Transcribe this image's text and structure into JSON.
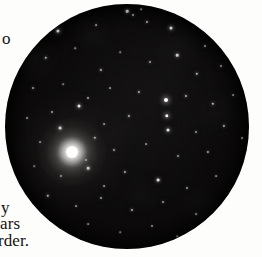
{
  "page": {
    "background_color": "#fdfdfb",
    "width": 262,
    "height": 257
  },
  "margin_text": {
    "top_fragment": "o",
    "bottom_fragment_1": "y",
    "bottom_fragment_2": "ars",
    "bottom_fragment_3": "rder."
  },
  "figure": {
    "kind": "telescopic-field-photograph",
    "shape": "circle",
    "center_x": 127,
    "center_y": 126,
    "radius": 122,
    "sky_color": "#0b0a0a",
    "star_color": "#ffffff",
    "primary_star": {
      "label": "bright-star",
      "x": 72,
      "y": 152,
      "core_radius": 6,
      "halo_radius": 34
    },
    "stars": [
      {
        "x": 127,
        "y": 11,
        "r": 1.3,
        "b": 0.8
      },
      {
        "x": 133,
        "y": 15,
        "r": 1.0,
        "b": 0.62
      },
      {
        "x": 141,
        "y": 9,
        "r": 0.8,
        "b": 0.5
      },
      {
        "x": 58,
        "y": 31,
        "r": 1.6,
        "b": 0.92
      },
      {
        "x": 96,
        "y": 25,
        "r": 0.9,
        "b": 0.55
      },
      {
        "x": 147,
        "y": 22,
        "r": 1.1,
        "b": 0.66
      },
      {
        "x": 171,
        "y": 28,
        "r": 1.5,
        "b": 0.88
      },
      {
        "x": 190,
        "y": 17,
        "r": 0.9,
        "b": 0.52
      },
      {
        "x": 205,
        "y": 46,
        "r": 1.0,
        "b": 0.58
      },
      {
        "x": 46,
        "y": 58,
        "r": 1.2,
        "b": 0.72
      },
      {
        "x": 75,
        "y": 48,
        "r": 0.8,
        "b": 0.48
      },
      {
        "x": 101,
        "y": 70,
        "r": 1.1,
        "b": 0.68
      },
      {
        "x": 120,
        "y": 52,
        "r": 0.8,
        "b": 0.46
      },
      {
        "x": 150,
        "y": 62,
        "r": 1.0,
        "b": 0.6
      },
      {
        "x": 177,
        "y": 55,
        "r": 1.3,
        "b": 0.78
      },
      {
        "x": 197,
        "y": 74,
        "r": 1.2,
        "b": 0.7
      },
      {
        "x": 221,
        "y": 66,
        "r": 1.0,
        "b": 0.58
      },
      {
        "x": 33,
        "y": 88,
        "r": 1.0,
        "b": 0.58
      },
      {
        "x": 63,
        "y": 84,
        "r": 0.8,
        "b": 0.44
      },
      {
        "x": 88,
        "y": 98,
        "r": 1.0,
        "b": 0.6
      },
      {
        "x": 110,
        "y": 88,
        "r": 0.9,
        "b": 0.5
      },
      {
        "x": 139,
        "y": 92,
        "r": 1.1,
        "b": 0.64
      },
      {
        "x": 166,
        "y": 100,
        "r": 2.0,
        "b": 1.0
      },
      {
        "x": 186,
        "y": 96,
        "r": 1.1,
        "b": 0.66
      },
      {
        "x": 213,
        "y": 104,
        "r": 1.2,
        "b": 0.72
      },
      {
        "x": 233,
        "y": 95,
        "r": 0.9,
        "b": 0.5
      },
      {
        "x": 27,
        "y": 118,
        "r": 0.9,
        "b": 0.5
      },
      {
        "x": 52,
        "y": 112,
        "r": 1.0,
        "b": 0.58
      },
      {
        "x": 79,
        "y": 106,
        "r": 1.5,
        "b": 0.9
      },
      {
        "x": 104,
        "y": 124,
        "r": 0.9,
        "b": 0.52
      },
      {
        "x": 129,
        "y": 116,
        "r": 1.1,
        "b": 0.66
      },
      {
        "x": 167,
        "y": 116,
        "r": 1.7,
        "b": 0.96
      },
      {
        "x": 168,
        "y": 130,
        "r": 1.5,
        "b": 0.88
      },
      {
        "x": 196,
        "y": 132,
        "r": 1.0,
        "b": 0.58
      },
      {
        "x": 224,
        "y": 126,
        "r": 1.1,
        "b": 0.64
      },
      {
        "x": 242,
        "y": 138,
        "r": 0.9,
        "b": 0.52
      },
      {
        "x": 40,
        "y": 142,
        "r": 0.9,
        "b": 0.5
      },
      {
        "x": 95,
        "y": 138,
        "r": 1.2,
        "b": 0.74
      },
      {
        "x": 114,
        "y": 150,
        "r": 1.0,
        "b": 0.58
      },
      {
        "x": 146,
        "y": 144,
        "r": 0.9,
        "b": 0.5
      },
      {
        "x": 178,
        "y": 156,
        "r": 1.0,
        "b": 0.56
      },
      {
        "x": 208,
        "y": 152,
        "r": 1.1,
        "b": 0.62
      },
      {
        "x": 34,
        "y": 166,
        "r": 0.8,
        "b": 0.44
      },
      {
        "x": 61,
        "y": 176,
        "r": 1.0,
        "b": 0.58
      },
      {
        "x": 88,
        "y": 168,
        "r": 1.3,
        "b": 0.8
      },
      {
        "x": 104,
        "y": 186,
        "r": 0.9,
        "b": 0.52
      },
      {
        "x": 125,
        "y": 172,
        "r": 1.1,
        "b": 0.64
      },
      {
        "x": 158,
        "y": 180,
        "r": 1.4,
        "b": 0.84
      },
      {
        "x": 187,
        "y": 188,
        "r": 1.0,
        "b": 0.56
      },
      {
        "x": 216,
        "y": 176,
        "r": 0.9,
        "b": 0.5
      },
      {
        "x": 48,
        "y": 196,
        "r": 1.2,
        "b": 0.72
      },
      {
        "x": 76,
        "y": 206,
        "r": 0.9,
        "b": 0.5
      },
      {
        "x": 101,
        "y": 198,
        "r": 1.0,
        "b": 0.58
      },
      {
        "x": 132,
        "y": 210,
        "r": 1.1,
        "b": 0.66
      },
      {
        "x": 163,
        "y": 202,
        "r": 1.0,
        "b": 0.56
      },
      {
        "x": 196,
        "y": 214,
        "r": 0.9,
        "b": 0.5
      },
      {
        "x": 88,
        "y": 224,
        "r": 0.9,
        "b": 0.48
      },
      {
        "x": 120,
        "y": 232,
        "r": 0.8,
        "b": 0.44
      },
      {
        "x": 152,
        "y": 226,
        "r": 1.0,
        "b": 0.54
      },
      {
        "x": 177,
        "y": 236,
        "r": 0.8,
        "b": 0.42
      },
      {
        "x": 60,
        "y": 128,
        "r": 1.4,
        "b": 0.85
      },
      {
        "x": 86,
        "y": 160,
        "r": 1.0,
        "b": 0.6
      }
    ]
  }
}
